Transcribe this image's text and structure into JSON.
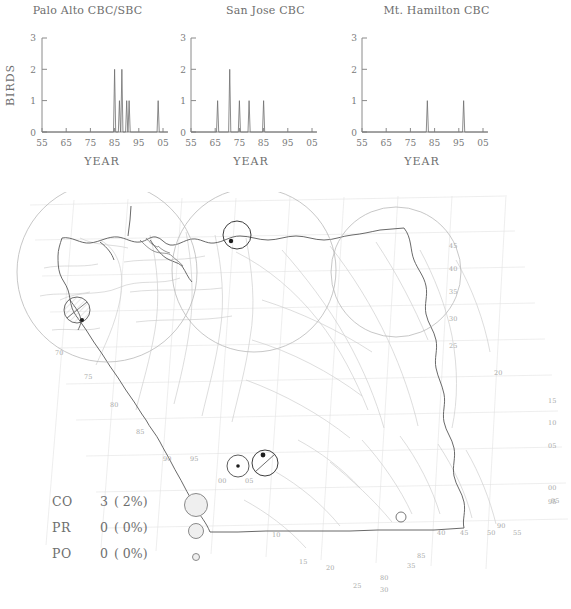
{
  "figure": {
    "yaxis_label": "BIRDS",
    "xaxis_label": "YEAR"
  },
  "chart_data": [
    {
      "type": "line",
      "title": "Palo Alto CBC/SBC",
      "xlabel": "YEAR",
      "ylabel": "BIRDS",
      "xlim": [
        55,
        107
      ],
      "ylim": [
        0,
        3
      ],
      "xticks": [
        "55",
        "65",
        "75",
        "85",
        "95",
        "05"
      ],
      "xtick_values": [
        55,
        65,
        75,
        85,
        95,
        105
      ],
      "yticks": [
        "0",
        "1",
        "2",
        "3"
      ],
      "ytick_values": [
        0,
        1,
        2,
        3
      ],
      "grid": false,
      "legend": "none",
      "x": [
        85,
        86,
        87,
        88,
        89,
        90,
        91,
        92,
        103
      ],
      "values": [
        2,
        0,
        1,
        2,
        0,
        1,
        1,
        0,
        1
      ],
      "points": [
        {
          "year": 85,
          "birds": 2
        },
        {
          "year": 87,
          "birds": 1
        },
        {
          "year": 88,
          "birds": 2
        },
        {
          "year": 90,
          "birds": 1
        },
        {
          "year": 91,
          "birds": 1
        },
        {
          "year": 103,
          "birds": 1
        }
      ]
    },
    {
      "type": "line",
      "title": "San Jose CBC",
      "xlabel": "YEAR",
      "ylabel": "BIRDS",
      "xlim": [
        55,
        107
      ],
      "ylim": [
        0,
        3
      ],
      "xticks": [
        "55",
        "65",
        "75",
        "85",
        "95",
        "05"
      ],
      "xtick_values": [
        55,
        65,
        75,
        85,
        95,
        105
      ],
      "yticks": [
        "0",
        "1",
        "2",
        "3"
      ],
      "ytick_values": [
        0,
        1,
        2,
        3
      ],
      "grid": false,
      "legend": "none",
      "x": [
        66,
        71,
        75,
        79,
        85
      ],
      "values": [
        1,
        2,
        1,
        1,
        1
      ],
      "points": [
        {
          "year": 66,
          "birds": 1
        },
        {
          "year": 71,
          "birds": 2
        },
        {
          "year": 75,
          "birds": 1
        },
        {
          "year": 79,
          "birds": 1
        },
        {
          "year": 85,
          "birds": 1
        }
      ]
    },
    {
      "type": "line",
      "title": "Mt. Hamilton CBC",
      "xlabel": "YEAR",
      "ylabel": "BIRDS",
      "xlim": [
        55,
        107
      ],
      "ylim": [
        0,
        3
      ],
      "xticks": [
        "55",
        "65",
        "75",
        "85",
        "95",
        "05"
      ],
      "xtick_values": [
        55,
        65,
        75,
        85,
        95,
        105
      ],
      "yticks": [
        "0",
        "1",
        "2",
        "3"
      ],
      "ytick_values": [
        0,
        1,
        2,
        3
      ],
      "grid": false,
      "legend": "none",
      "x": [
        82,
        97
      ],
      "values": [
        1,
        1
      ],
      "points": [
        {
          "year": 82,
          "birds": 1
        },
        {
          "year": 97,
          "birds": 1
        }
      ]
    }
  ],
  "map": {
    "grid_labels": [
      {
        "text": "45",
        "x": 449,
        "y": 248
      },
      {
        "text": "40",
        "x": 449,
        "y": 271
      },
      {
        "text": "35",
        "x": 449,
        "y": 294
      },
      {
        "text": "30",
        "x": 449,
        "y": 321
      },
      {
        "text": "25",
        "x": 449,
        "y": 348
      },
      {
        "text": "20",
        "x": 494,
        "y": 375
      },
      {
        "text": "15",
        "x": 548,
        "y": 403
      },
      {
        "text": "10",
        "x": 548,
        "y": 425
      },
      {
        "text": "05",
        "x": 548,
        "y": 448
      },
      {
        "text": "00",
        "x": 548,
        "y": 490
      },
      {
        "text": "95",
        "x": 548,
        "y": 504
      },
      {
        "text": "70",
        "x": 55,
        "y": 355
      },
      {
        "text": "75",
        "x": 84,
        "y": 379
      },
      {
        "text": "80",
        "x": 110,
        "y": 407
      },
      {
        "text": "85",
        "x": 136,
        "y": 434
      },
      {
        "text": "90",
        "x": 163,
        "y": 461
      },
      {
        "text": "95",
        "x": 190,
        "y": 461
      },
      {
        "text": "00",
        "x": 218,
        "y": 483
      },
      {
        "text": "05",
        "x": 245,
        "y": 483
      },
      {
        "text": "10",
        "x": 272,
        "y": 537
      },
      {
        "text": "15",
        "x": 299,
        "y": 564
      },
      {
        "text": "20",
        "x": 326,
        "y": 570
      },
      {
        "text": "25",
        "x": 353,
        "y": 588
      },
      {
        "text": "30",
        "x": 380,
        "y": 592
      },
      {
        "text": "35",
        "x": 407,
        "y": 568
      },
      {
        "text": "80",
        "x": 380,
        "y": 580
      },
      {
        "text": "85",
        "x": 417,
        "y": 558
      },
      {
        "text": "40",
        "x": 437,
        "y": 535
      },
      {
        "text": "45",
        "x": 460,
        "y": 535
      },
      {
        "text": "50",
        "x": 487,
        "y": 535
      },
      {
        "text": "55",
        "x": 513,
        "y": 535
      },
      {
        "text": "90",
        "x": 497,
        "y": 528
      },
      {
        "text": "95",
        "x": 551,
        "y": 503
      }
    ],
    "range_circles": [
      {
        "cx": 107,
        "cy": 272,
        "r": 90
      },
      {
        "cx": 254,
        "cy": 270,
        "r": 82
      },
      {
        "cx": 396,
        "cy": 272,
        "r": 65
      }
    ],
    "record_circles": [
      {
        "cx": 77,
        "cy": 310,
        "r": 13,
        "hatched": true
      },
      {
        "cx": 237,
        "cy": 235,
        "r": 14,
        "hatched": false
      },
      {
        "cx": 238,
        "cy": 466,
        "r": 11,
        "hatched": false
      },
      {
        "cx": 265,
        "cy": 463,
        "r": 13,
        "hatched": true
      },
      {
        "cx": 401,
        "cy": 517,
        "r": 5,
        "hatched": false
      }
    ],
    "record_dots": [
      {
        "cx": 82,
        "cy": 320,
        "r": 2
      },
      {
        "cx": 231,
        "cy": 241,
        "r": 2.2
      },
      {
        "cx": 238,
        "cy": 466,
        "r": 1.8
      },
      {
        "cx": 263,
        "cy": 455,
        "r": 2.4
      }
    ]
  },
  "legend": {
    "rows": [
      {
        "code": "CO",
        "count": "3",
        "percent": "( 2%)",
        "symbol_size": 22
      },
      {
        "code": "PR",
        "count": "0",
        "percent": "( 0%)",
        "symbol_size": 14
      },
      {
        "code": "PO",
        "count": "0",
        "percent": "( 0%)",
        "symbol_size": 6
      }
    ]
  },
  "colors": {
    "ink": "#6e6e6e",
    "axis": "#8a8a8a",
    "coast": "#555555",
    "river": "#c2c2c2",
    "grid": "#dcdcdc",
    "circle": "#8a8a8a"
  }
}
